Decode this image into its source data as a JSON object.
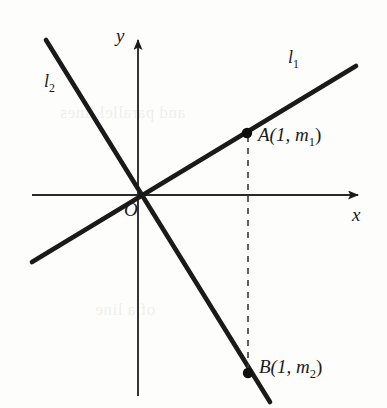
{
  "figure": {
    "background_color": "#fdfdfb",
    "ink_color": "#1a1a1a",
    "width": 387,
    "height": 408
  },
  "axes": {
    "x_label": "x",
    "y_label": "y",
    "origin_label": "O",
    "x_axis": {
      "x1": 32,
      "y1": 195,
      "x2": 366,
      "y2": 195,
      "arrow": "right"
    },
    "y_axis": {
      "x1": 138,
      "y1": 396,
      "x2": 138,
      "y2": 32,
      "arrow": "up"
    },
    "x_label_pos": {
      "x": 352,
      "y": 206
    },
    "y_label_pos": {
      "x": 118,
      "y": 27
    },
    "origin_label_pos": {
      "x": 124,
      "y": 200
    }
  },
  "lines": [
    {
      "name": "l1",
      "label": "l",
      "label_sub": "1",
      "label_pos": {
        "x": 288,
        "y": 50
      },
      "x1": 32,
      "y1": 262,
      "x2": 356,
      "y2": 66,
      "stroke_width": 4.6
    },
    {
      "name": "l2",
      "label": "l",
      "label_sub": "2",
      "label_pos": {
        "x": 44,
        "y": 72
      },
      "x1": 46,
      "y1": 40,
      "x2": 270,
      "y2": 402,
      "stroke_width": 4.6
    }
  ],
  "points": [
    {
      "name": "A",
      "label_main": "A(1, ",
      "label_var": "m",
      "label_sub": "1",
      "label_close": ")",
      "full_label": "A(1, m1)",
      "x": 247,
      "y": 133,
      "radius": 5.2,
      "label_pos": {
        "x": 258,
        "y": 126
      }
    },
    {
      "name": "B",
      "label_main": "B(1, ",
      "label_var": "m",
      "label_sub": "2",
      "label_close": ")",
      "full_label": "B(1, m2)",
      "x": 248,
      "y": 373,
      "radius": 5.2,
      "label_pos": {
        "x": 259,
        "y": 358
      }
    }
  ],
  "dashed_segment": {
    "name": "vertical-dashed-connector",
    "x1": 248,
    "y1": 136,
    "x2": 248,
    "y2": 370,
    "dash": "6 6",
    "stroke_width": 1.6
  },
  "ghost_text": {
    "line1": "and parallel lines",
    "line2": "of a line"
  }
}
